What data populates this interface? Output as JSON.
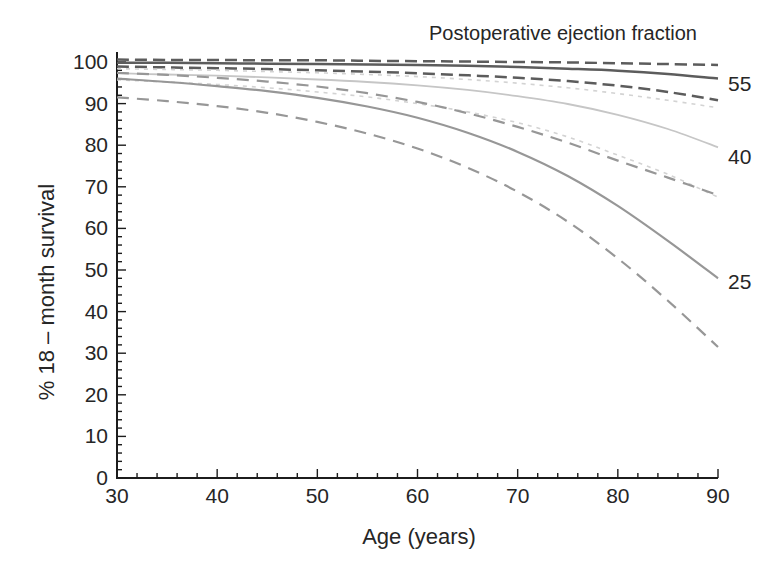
{
  "figure": {
    "background": "#ffffff",
    "text_color": "#262626",
    "axis_color": "#1c1c1c"
  },
  "chart_data": {
    "type": "line",
    "title": "Postoperative ejection fraction",
    "xlabel": "Age (years)",
    "ylabel": "% 18 – month survival",
    "xlim": [
      30,
      90
    ],
    "ylim": [
      0,
      100
    ],
    "grid": false,
    "x_major_ticks": [
      30,
      40,
      50,
      60,
      70,
      80,
      90
    ],
    "y_major_ticks": [
      0,
      10,
      20,
      30,
      40,
      50,
      60,
      70,
      80,
      90,
      100
    ],
    "minor_tick_step": 2,
    "x": [
      30,
      35,
      40,
      45,
      50,
      55,
      60,
      65,
      70,
      75,
      80,
      85,
      90
    ],
    "series": [
      {
        "name": "EF 55 survival",
        "group": "55",
        "role": "mean",
        "color": "#5c5c5c",
        "width": 2.5,
        "dash": null,
        "values": [
          99.8,
          99.8,
          99.7,
          99.6,
          99.5,
          99.4,
          99.3,
          99.1,
          98.8,
          98.4,
          97.9,
          97.1,
          96.0
        ]
      },
      {
        "name": "EF 55 upper CI",
        "group": "55",
        "role": "upper",
        "color": "#5c5c5c",
        "width": 2.5,
        "dash": "12 6",
        "values": [
          100.6,
          100.5,
          100.5,
          100.4,
          100.4,
          100.3,
          100.2,
          100.1,
          100.0,
          99.9,
          99.7,
          99.5,
          99.3
        ]
      },
      {
        "name": "EF 55 lower CI",
        "group": "55",
        "role": "lower",
        "color": "#5c5c5c",
        "width": 2.5,
        "dash": "12 6",
        "values": [
          98.9,
          98.7,
          98.5,
          98.3,
          98.0,
          97.7,
          97.3,
          96.8,
          96.2,
          95.4,
          94.3,
          92.8,
          90.8
        ]
      },
      {
        "name": "EF 40 survival",
        "group": "40",
        "role": "mean",
        "color": "#c6c6c6",
        "width": 1.8,
        "dash": null,
        "values": [
          97.3,
          97.0,
          96.7,
          96.3,
          95.8,
          95.2,
          94.4,
          93.3,
          91.8,
          89.9,
          87.3,
          83.9,
          79.5
        ]
      },
      {
        "name": "EF 40 upper CI",
        "group": "40",
        "role": "upper",
        "color": "#d3d3d3",
        "width": 1.6,
        "dash": "4 5",
        "values": [
          98.4,
          98.2,
          98.0,
          97.7,
          97.4,
          97.0,
          96.5,
          95.8,
          94.9,
          93.8,
          92.4,
          90.8,
          89.0
        ]
      },
      {
        "name": "EF 40 lower CI",
        "group": "40",
        "role": "lower",
        "color": "#d3d3d3",
        "width": 1.6,
        "dash": "4 5",
        "values": [
          95.7,
          95.2,
          94.6,
          93.8,
          92.8,
          91.6,
          90.0,
          88.0,
          85.4,
          82.0,
          77.6,
          73.0,
          67.5
        ]
      },
      {
        "name": "EF 25 survival",
        "group": "25",
        "role": "mean",
        "color": "#979797",
        "width": 2.2,
        "dash": null,
        "values": [
          96.0,
          95.2,
          94.2,
          93.0,
          91.4,
          89.3,
          86.6,
          83.0,
          78.4,
          72.6,
          65.4,
          57.0,
          48.0
        ]
      },
      {
        "name": "EF 25 upper CI",
        "group": "25",
        "role": "upper",
        "color": "#979797",
        "width": 2.2,
        "dash": "12 8",
        "values": [
          97.4,
          96.9,
          96.2,
          95.3,
          94.1,
          92.5,
          90.4,
          87.7,
          84.4,
          80.6,
          76.3,
          72.2,
          68.0
        ]
      },
      {
        "name": "EF 25 lower CI",
        "group": "25",
        "role": "lower",
        "color": "#979797",
        "width": 2.2,
        "dash": "12 8",
        "values": [
          91.5,
          90.6,
          89.4,
          87.8,
          85.6,
          82.8,
          79.2,
          74.6,
          68.8,
          61.6,
          52.8,
          42.6,
          31.5
        ]
      }
    ],
    "curve_labels": [
      {
        "text": "55",
        "at_value": 94.6
      },
      {
        "text": "40",
        "at_value": 77.2
      },
      {
        "text": "25",
        "at_value": 47.0
      }
    ]
  }
}
